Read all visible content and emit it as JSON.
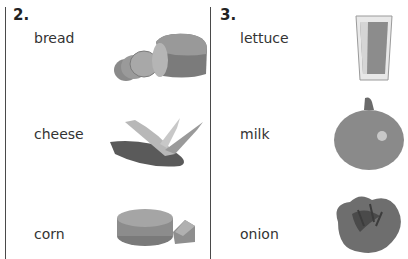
{
  "sections": [
    {
      "number": "2.",
      "words": [
        "bread",
        "cheese",
        "corn"
      ],
      "pictures": [
        "bread-loaf",
        "corn-husk",
        "cheese-wheel"
      ]
    },
    {
      "number": "3.",
      "words": [
        "lettuce",
        "milk",
        "onion"
      ],
      "pictures": [
        "milk-glass",
        "onion",
        "lettuce"
      ]
    }
  ],
  "colors": {
    "line": "#4a4a4a",
    "text": "#333333"
  }
}
